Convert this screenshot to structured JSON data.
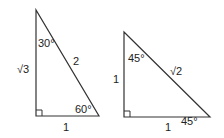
{
  "diagram": {
    "colors": {
      "stroke": "#333333",
      "text": "#222222",
      "background": "#ffffff"
    },
    "triangles": [
      {
        "name": "30-60-90",
        "angle_top": "30°",
        "angle_bottom_right": "60°",
        "side_vertical": "√3",
        "side_hypotenuse": "2",
        "side_base": "1",
        "right_angle_marker": true
      },
      {
        "name": "45-45-90",
        "angle_top": "45°",
        "angle_bottom_right": "45°",
        "side_vertical": "1",
        "side_hypotenuse": "√2",
        "side_base": "1",
        "right_angle_marker": true
      }
    ]
  }
}
